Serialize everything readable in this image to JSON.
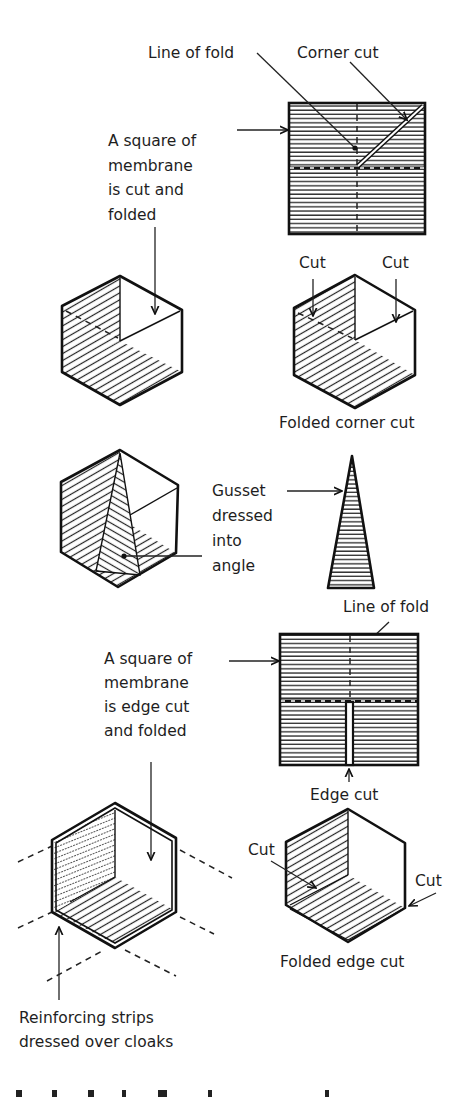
{
  "figure": {
    "top_section": {
      "line_of_fold_label": "Line of fold",
      "corner_cut_label": "Corner cut",
      "square_label_lines": [
        "A square of",
        "membrane",
        "is cut and",
        "folded"
      ]
    },
    "folded_corner": {
      "cut_left_label": "Cut",
      "cut_right_label": "Cut",
      "caption": "Folded corner cut"
    },
    "gusset": {
      "label_lines": [
        "Gusset",
        "dressed",
        "into",
        "angle"
      ]
    },
    "edge_section": {
      "line_of_fold_label": "Line of fold",
      "square_label_lines": [
        "A square of",
        "membrane",
        "is edge cut",
        "and folded"
      ],
      "edge_cut_label": "Edge cut"
    },
    "folded_edge": {
      "cut_left_label": "Cut",
      "cut_right_label": "Cut",
      "caption": "Folded edge cut"
    },
    "reinforcing": {
      "label_lines": [
        "Reinforcing strips",
        "dressed over cloaks"
      ]
    }
  },
  "colors": {
    "ink": "#111111",
    "background": "#ffffff"
  }
}
